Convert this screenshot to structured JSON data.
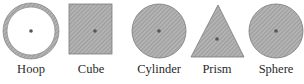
{
  "figure": {
    "shapes": [
      {
        "id": "hoop",
        "label": "Hoop",
        "kind": "ring"
      },
      {
        "id": "cube",
        "label": "Cube",
        "kind": "square"
      },
      {
        "id": "cylinder",
        "label": "Cylinder",
        "kind": "disc"
      },
      {
        "id": "prism",
        "label": "Prism",
        "kind": "triangle"
      },
      {
        "id": "sphere",
        "label": "Sphere",
        "kind": "disc"
      }
    ],
    "colors": {
      "fill": "#a9a9a9",
      "hatch": "#8a8a8a",
      "outline": "#6e6e6e",
      "center_dot": "#555555"
    }
  }
}
